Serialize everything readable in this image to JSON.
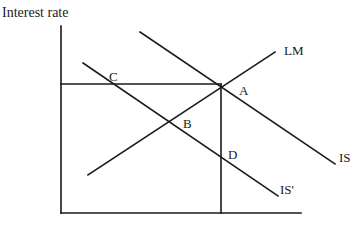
{
  "diagram": {
    "type": "IS-LM diagram",
    "y_axis_label": "Interest rate",
    "curves": [
      {
        "name": "LM",
        "label": "LM"
      },
      {
        "name": "IS",
        "label": "IS"
      },
      {
        "name": "IS-prime",
        "label": "IS'"
      }
    ],
    "points": [
      {
        "label": "A",
        "description": "Intersection of LM and IS"
      },
      {
        "label": "B",
        "description": "Intersection of LM and IS'"
      },
      {
        "label": "C",
        "description": "Intersection of horizontal line at A's interest rate with IS'"
      },
      {
        "label": "D",
        "description": "Intersection of vertical line at A's output with IS'"
      }
    ],
    "colors": {
      "line": "#1a1a1a",
      "background": "#ffffff"
    }
  }
}
